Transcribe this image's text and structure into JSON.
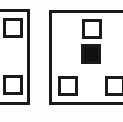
{
  "figure": {
    "background_color": "#fdfdfd",
    "stroke_color": "#1a1a1a",
    "fill_color": "#111111",
    "width": 123,
    "height": 122
  },
  "panels": [
    {
      "id": "left-panel",
      "label": "Left panel",
      "note": "cropped at left image edge",
      "x": -12,
      "y": 9,
      "width": 42,
      "height": 96,
      "border_width": 3,
      "ports": [
        {
          "id": "left-panel-port-top",
          "label": "Top square port",
          "state": "open",
          "x": 3,
          "y": 18,
          "width": 20,
          "height": 20,
          "border_width": 3
        },
        {
          "id": "left-panel-port-bottom",
          "label": "Bottom square port",
          "state": "open",
          "x": 3,
          "y": 75,
          "width": 20,
          "height": 20,
          "border_width": 3
        }
      ]
    },
    {
      "id": "right-panel",
      "label": "Right panel",
      "note": "cropped at right image edge",
      "x": 49,
      "y": 10,
      "width": 86,
      "height": 95,
      "border_width": 3,
      "ports": [
        {
          "id": "right-panel-port-top",
          "label": "Top centre square port",
          "state": "open",
          "x": 82,
          "y": 19,
          "width": 20,
          "height": 20,
          "border_width": 3
        },
        {
          "id": "right-panel-port-centre",
          "label": "Centre filled square port",
          "state": "filled",
          "x": 81,
          "y": 44,
          "width": 20,
          "height": 20,
          "border_width": 3
        },
        {
          "id": "right-panel-port-bottom-left",
          "label": "Bottom left square port",
          "state": "open",
          "x": 58,
          "y": 76,
          "width": 20,
          "height": 20,
          "border_width": 3
        },
        {
          "id": "right-panel-port-bottom-right",
          "label": "Bottom right square port",
          "state": "open",
          "x": 105,
          "y": 76,
          "width": 20,
          "height": 20,
          "border_width": 3
        }
      ]
    }
  ]
}
